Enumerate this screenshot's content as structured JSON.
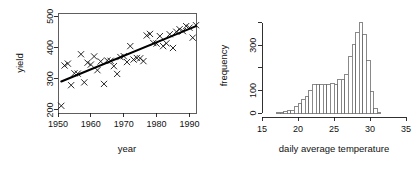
{
  "figure": {
    "background": "#ffffff",
    "panel_count": 2
  },
  "chart_data": [
    {
      "type": "scatter",
      "id": "yield-vs-year",
      "title": "",
      "xlabel": "year",
      "ylabel": "yield",
      "xlim": [
        1950,
        1992
      ],
      "ylim": [
        190,
        510
      ],
      "xticks": [
        1950,
        1960,
        1970,
        1980,
        1990
      ],
      "xticklabels": [
        "1950",
        "1960",
        "1970",
        "1980",
        "1990"
      ],
      "yticks": [
        200,
        300,
        400,
        500
      ],
      "yticklabels": [
        "200",
        "300",
        "400",
        "500"
      ],
      "grid": false,
      "legend": "none",
      "marker": "x",
      "marker_color": "#111111",
      "points": [
        {
          "x": 1951,
          "y": 213
        },
        {
          "x": 1952,
          "y": 342
        },
        {
          "x": 1953,
          "y": 348
        },
        {
          "x": 1954,
          "y": 279
        },
        {
          "x": 1955,
          "y": 317
        },
        {
          "x": 1956,
          "y": 316
        },
        {
          "x": 1957,
          "y": 378
        },
        {
          "x": 1958,
          "y": 288
        },
        {
          "x": 1959,
          "y": 351
        },
        {
          "x": 1960,
          "y": 345
        },
        {
          "x": 1961,
          "y": 371
        },
        {
          "x": 1962,
          "y": 327
        },
        {
          "x": 1963,
          "y": 355
        },
        {
          "x": 1964,
          "y": 283
        },
        {
          "x": 1965,
          "y": 358
        },
        {
          "x": 1966,
          "y": 357
        },
        {
          "x": 1967,
          "y": 340
        },
        {
          "x": 1968,
          "y": 315
        },
        {
          "x": 1969,
          "y": 369
        },
        {
          "x": 1970,
          "y": 372
        },
        {
          "x": 1971,
          "y": 353
        },
        {
          "x": 1972,
          "y": 404
        },
        {
          "x": 1973,
          "y": 361
        },
        {
          "x": 1974,
          "y": 366
        },
        {
          "x": 1975,
          "y": 365
        },
        {
          "x": 1976,
          "y": 356
        },
        {
          "x": 1977,
          "y": 438
        },
        {
          "x": 1978,
          "y": 443
        },
        {
          "x": 1979,
          "y": 414
        },
        {
          "x": 1980,
          "y": 412
        },
        {
          "x": 1981,
          "y": 436
        },
        {
          "x": 1982,
          "y": 404
        },
        {
          "x": 1983,
          "y": 413
        },
        {
          "x": 1984,
          "y": 442
        },
        {
          "x": 1985,
          "y": 398
        },
        {
          "x": 1986,
          "y": 450
        },
        {
          "x": 1987,
          "y": 458
        },
        {
          "x": 1988,
          "y": 452
        },
        {
          "x": 1989,
          "y": 468
        },
        {
          "x": 1990,
          "y": 463
        },
        {
          "x": 1991,
          "y": 431
        },
        {
          "x": 1992,
          "y": 471
        }
      ],
      "fit_line": {
        "label": "linear fit",
        "color": "#000000",
        "x_start": 1951,
        "y_start": 291,
        "x_end": 1992,
        "y_end": 468
      }
    },
    {
      "type": "bar",
      "id": "temperature-histogram",
      "title": "",
      "xlabel": "daily average temperature",
      "ylabel": "frequency",
      "xlim": [
        15,
        35
      ],
      "ylim": [
        0,
        420
      ],
      "xticks": [
        15,
        20,
        25,
        30,
        35
      ],
      "xticklabels": [
        "15",
        "20",
        "25",
        "30",
        "35"
      ],
      "yticks": [
        0,
        100,
        200,
        300,
        400
      ],
      "yticklabels": [
        "0",
        "100",
        "",
        "300",
        ""
      ],
      "grid": false,
      "legend": "none",
      "bin_width": 0.5,
      "bar_fill": "#ffffff",
      "bar_stroke": "#6b6b6b",
      "bins": [
        {
          "x": 17.0,
          "value": 2
        },
        {
          "x": 17.5,
          "value": 3
        },
        {
          "x": 18.0,
          "value": 8
        },
        {
          "x": 18.5,
          "value": 10
        },
        {
          "x": 19.0,
          "value": 12
        },
        {
          "x": 19.5,
          "value": 30
        },
        {
          "x": 20.0,
          "value": 42
        },
        {
          "x": 20.5,
          "value": 58
        },
        {
          "x": 21.0,
          "value": 72
        },
        {
          "x": 21.5,
          "value": 98
        },
        {
          "x": 22.0,
          "value": 128
        },
        {
          "x": 22.5,
          "value": 126
        },
        {
          "x": 23.0,
          "value": 126
        },
        {
          "x": 23.5,
          "value": 128
        },
        {
          "x": 24.0,
          "value": 124
        },
        {
          "x": 24.5,
          "value": 129
        },
        {
          "x": 25.0,
          "value": 128
        },
        {
          "x": 25.5,
          "value": 146
        },
        {
          "x": 26.0,
          "value": 150
        },
        {
          "x": 26.5,
          "value": 172
        },
        {
          "x": 27.0,
          "value": 250
        },
        {
          "x": 27.5,
          "value": 305
        },
        {
          "x": 28.0,
          "value": 355
        },
        {
          "x": 28.5,
          "value": 400
        },
        {
          "x": 29.0,
          "value": 348
        },
        {
          "x": 29.5,
          "value": 232
        },
        {
          "x": 30.0,
          "value": 93
        },
        {
          "x": 30.5,
          "value": 18
        },
        {
          "x": 31.0,
          "value": 4
        }
      ]
    }
  ]
}
